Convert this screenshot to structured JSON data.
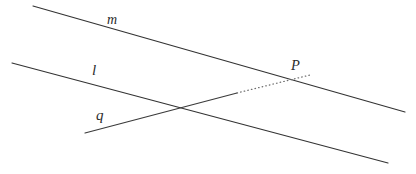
{
  "diagram": {
    "background_color": "#ffffff",
    "stroke_color": "#333333",
    "dotted_stroke_color": "#6e6e6e",
    "width": 416,
    "height": 174,
    "lines": [
      {
        "id": "m",
        "label": "m",
        "style": "solid",
        "x1": 33,
        "y1": 6,
        "x2": 405,
        "y2": 112,
        "label_x": 113,
        "label_y": 22
      },
      {
        "id": "l",
        "label": "l",
        "style": "solid",
        "x1": 12,
        "y1": 63,
        "x2": 388,
        "y2": 163,
        "label_x": 95,
        "label_y": 73
      },
      {
        "id": "q",
        "label": "q",
        "style": "solid-then-dotted",
        "x1": 85,
        "y1": 133,
        "x2": 237,
        "y2": 93,
        "label_x": 101,
        "label_y": 117
      }
    ],
    "dotted_segment": {
      "id": "q-extension",
      "style": "dotted",
      "x1": 237,
      "y1": 93,
      "x2": 310,
      "y2": 75
    },
    "points": [
      {
        "id": "P",
        "label": "P",
        "x": 299,
        "y": 79,
        "label_x": 296,
        "label_y": 67,
        "on_line": "m"
      }
    ],
    "intersections": [
      {
        "lines": [
          "l",
          "q"
        ],
        "x": 182,
        "y": 110
      }
    ]
  }
}
